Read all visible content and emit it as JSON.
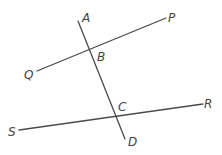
{
  "diagram": {
    "type": "geometry-lines",
    "line_color": "#4a4a4a",
    "label_color": "#444444",
    "lines": [
      {
        "name": "AD",
        "from": "A",
        "to": "D"
      },
      {
        "name": "QP",
        "from": "Q",
        "to": "P"
      },
      {
        "name": "SR",
        "from": "S",
        "to": "R"
      }
    ],
    "intersections": [
      {
        "point": "B",
        "lines": [
          "AD",
          "QP"
        ]
      },
      {
        "point": "C",
        "lines": [
          "AD",
          "SR"
        ]
      }
    ],
    "labels": {
      "A": "A",
      "B": "B",
      "C": "C",
      "D": "D",
      "P": "P",
      "Q": "Q",
      "R": "R",
      "S": "S"
    }
  }
}
